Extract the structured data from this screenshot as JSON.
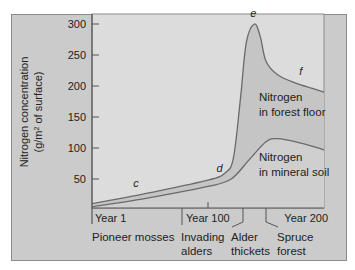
{
  "chart_data": {
    "type": "area",
    "title": "",
    "ylabel_line1": "Nitrogen concentration",
    "ylabel_line2_prefix": "(g/m",
    "ylabel_line2_sup": "2",
    "ylabel_line2_suffix": " of surface)",
    "xlabel": "",
    "xlim": [
      0,
      200
    ],
    "ylim": [
      0,
      315
    ],
    "yticks": [
      50,
      100,
      150,
      200,
      250,
      300
    ],
    "ytick_labels": [
      "50",
      "100",
      "150",
      "200",
      "250",
      "300"
    ],
    "xticks": [
      {
        "x": 0,
        "label": "Year 1"
      },
      {
        "x": 100,
        "label": "Year 100"
      },
      {
        "x": 200,
        "label": "Year 200"
      }
    ],
    "grid": false,
    "series": [
      {
        "name": "Nitrogen in forest floor",
        "label_line1": "Nitrogen",
        "label_line2": "in forest floor",
        "fill": "#c5c5c5",
        "x": [
          0,
          50,
          100,
          115,
          122,
          128,
          133,
          140,
          145,
          150,
          160,
          175,
          190,
          200
        ],
        "values": [
          10,
          28,
          48,
          60,
          85,
          180,
          270,
          300,
          280,
          240,
          218,
          205,
          196,
          190
        ]
      },
      {
        "name": "Nitrogen in mineral soil",
        "label_line1": "Nitrogen",
        "label_line2": "in mineral soil",
        "fill": "#cfcfcf",
        "x": [
          0,
          50,
          100,
          120,
          135,
          150,
          160,
          180,
          200
        ],
        "values": [
          5,
          20,
          38,
          50,
          80,
          110,
          115,
          108,
          97
        ]
      }
    ],
    "annotations": [
      {
        "text": "c",
        "x": 38,
        "y": 37
      },
      {
        "text": "d",
        "x": 110,
        "y": 62
      },
      {
        "text": "e",
        "x": 139,
        "y": 312
      },
      {
        "text": "f",
        "x": 180,
        "y": 218
      }
    ],
    "stages": [
      {
        "line1": "Pioneer mosses",
        "line2": "",
        "x": 0
      },
      {
        "line1": "Invading",
        "line2": "alders",
        "x": 78
      },
      {
        "line1": "Alder",
        "line2": "thickets",
        "x": 130
      },
      {
        "line1": "Spruce",
        "line2": "forest",
        "x": 150
      }
    ],
    "colors": {
      "frame": "#cbcbcb",
      "plot_bg": "#dcdcdc",
      "line": "#6a6a6a",
      "axis": "#555555"
    }
  }
}
